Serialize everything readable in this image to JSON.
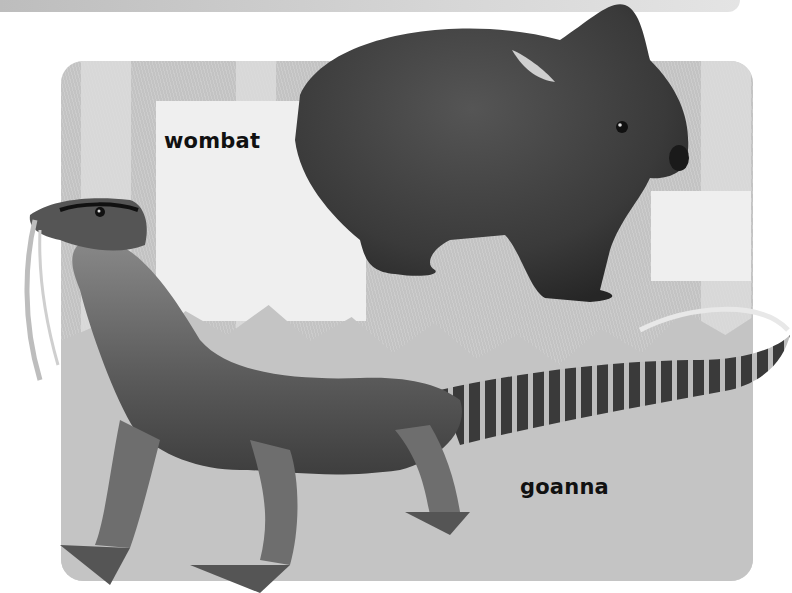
{
  "illustration": {
    "labels": {
      "wombat": "wombat",
      "goanna": "goanna"
    },
    "colors": {
      "panel_background": "#c9c9c9",
      "wombat_fur": "#3c3c3c",
      "goanna_skin": "#6a6a6a",
      "label_text": "#111111"
    }
  }
}
